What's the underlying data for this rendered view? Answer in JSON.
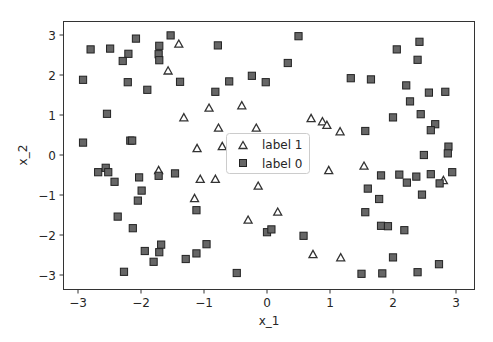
{
  "chart_data": {
    "type": "scatter",
    "title": "",
    "xlabel": "x_1",
    "ylabel": "x_2",
    "xlim": [
      -3.24,
      3.3
    ],
    "ylim": [
      -3.35,
      3.35
    ],
    "xticks": [
      -3,
      -2,
      -1,
      0,
      1,
      2,
      3
    ],
    "yticks": [
      -3,
      -2,
      -1,
      0,
      1,
      2,
      3
    ],
    "xtick_labels": [
      "−3",
      "−2",
      "−1",
      "0",
      "1",
      "2",
      "3"
    ],
    "ytick_labels": [
      "−3",
      "−2",
      "−1",
      "0",
      "1",
      "2",
      "3"
    ],
    "grid": false,
    "legend": {
      "position": "center",
      "entries": [
        {
          "label": "label 1",
          "marker": "triangle"
        },
        {
          "label": "label 0",
          "marker": "square"
        }
      ]
    },
    "series": [
      {
        "name": "label 1",
        "marker": "triangle",
        "color": "#ffffff",
        "edgecolor": "#333333",
        "points": [
          [
            -1.4,
            2.77
          ],
          [
            -1.57,
            2.1
          ],
          [
            -1.32,
            0.93
          ],
          [
            -0.92,
            1.17
          ],
          [
            -0.4,
            1.23
          ],
          [
            -0.77,
            0.67
          ],
          [
            -0.17,
            0.67
          ],
          [
            0.7,
            0.91
          ],
          [
            0.88,
            0.83
          ],
          [
            0.95,
            0.74
          ],
          [
            1.16,
            0.58
          ],
          [
            -1.11,
            0.16
          ],
          [
            -0.71,
            0.21
          ],
          [
            -1.72,
            -0.39
          ],
          [
            -1.06,
            -0.61
          ],
          [
            -0.82,
            -0.61
          ],
          [
            -1.15,
            -1.09
          ],
          [
            -0.3,
            -1.63
          ],
          [
            0.98,
            -0.39
          ],
          [
            1.54,
            -0.28
          ],
          [
            -0.14,
            -0.78
          ],
          [
            0.17,
            -1.43
          ],
          [
            0.73,
            -2.49
          ],
          [
            1.17,
            -2.57
          ],
          [
            2.8,
            -0.64
          ]
        ]
      },
      {
        "name": "label 0",
        "marker": "square",
        "color": "#666666",
        "edgecolor": "#222222",
        "points": [
          [
            -2.8,
            2.64
          ],
          [
            -2.49,
            2.66
          ],
          [
            -2.08,
            2.91
          ],
          [
            -1.53,
            2.99
          ],
          [
            -1.71,
            2.73
          ],
          [
            -2.2,
            2.53
          ],
          [
            -2.29,
            2.35
          ],
          [
            -1.72,
            2.52
          ],
          [
            -1.71,
            2.37
          ],
          [
            -2.92,
            1.88
          ],
          [
            -2.21,
            1.82
          ],
          [
            -1.9,
            1.63
          ],
          [
            -1.38,
            1.83
          ],
          [
            -2.54,
            1.03
          ],
          [
            -0.78,
            2.74
          ],
          [
            0.5,
            2.97
          ],
          [
            0.33,
            2.3
          ],
          [
            -0.6,
            1.84
          ],
          [
            -0.24,
            1.98
          ],
          [
            -0.02,
            1.82
          ],
          [
            -0.82,
            1.58
          ],
          [
            2.42,
            2.83
          ],
          [
            2.06,
            2.64
          ],
          [
            2.39,
            2.38
          ],
          [
            1.33,
            1.92
          ],
          [
            1.65,
            1.89
          ],
          [
            2.21,
            1.74
          ],
          [
            2.57,
            1.56
          ],
          [
            2.83,
            1.58
          ],
          [
            2.27,
            1.34
          ],
          [
            2.0,
            0.94
          ],
          [
            2.44,
            1.02
          ],
          [
            2.67,
            0.77
          ],
          [
            2.6,
            0.62
          ],
          [
            1.56,
            0.6
          ],
          [
            2.88,
            0.21
          ],
          [
            -2.92,
            0.31
          ],
          [
            -2.17,
            0.36
          ],
          [
            -2.14,
            0.36
          ],
          [
            -2.68,
            -0.43
          ],
          [
            -2.56,
            -0.32
          ],
          [
            -2.52,
            -0.43
          ],
          [
            -2.42,
            -0.67
          ],
          [
            -2.03,
            -0.56
          ],
          [
            -1.99,
            -0.89
          ],
          [
            -2.05,
            -1.14
          ],
          [
            -1.72,
            -0.52
          ],
          [
            -1.46,
            -0.46
          ],
          [
            -2.37,
            -1.54
          ],
          [
            -2.13,
            -1.83
          ],
          [
            -1.12,
            -1.38
          ],
          [
            -1.94,
            -2.4
          ],
          [
            -1.68,
            -2.24
          ],
          [
            -1.71,
            -2.43
          ],
          [
            -1.8,
            -2.67
          ],
          [
            -2.27,
            -2.92
          ],
          [
            -1.29,
            -2.6
          ],
          [
            -1.12,
            -2.46
          ],
          [
            -0.96,
            -2.23
          ],
          [
            -0.48,
            -2.95
          ],
          [
            0.0,
            -1.93
          ],
          [
            0.07,
            -1.86
          ],
          [
            0.58,
            -2.02
          ],
          [
            1.5,
            -2.97
          ],
          [
            2.87,
            0.04
          ],
          [
            2.49,
            0.0
          ],
          [
            1.81,
            -0.51
          ],
          [
            2.1,
            -0.49
          ],
          [
            2.22,
            -0.69
          ],
          [
            2.37,
            -0.54
          ],
          [
            2.6,
            -0.48
          ],
          [
            2.74,
            -0.71
          ],
          [
            2.94,
            -0.43
          ],
          [
            1.6,
            -0.84
          ],
          [
            1.78,
            -1.1
          ],
          [
            2.46,
            -0.99
          ],
          [
            1.56,
            -1.43
          ],
          [
            1.81,
            -1.77
          ],
          [
            1.92,
            -1.78
          ],
          [
            2.18,
            -1.88
          ],
          [
            2.0,
            -2.56
          ],
          [
            2.73,
            -2.73
          ],
          [
            1.83,
            -2.96
          ],
          [
            2.39,
            -2.93
          ]
        ]
      }
    ]
  }
}
